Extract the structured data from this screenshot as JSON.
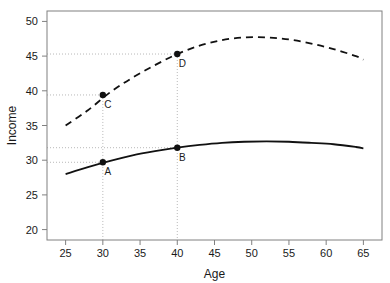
{
  "chart_data": {
    "type": "line",
    "title": "",
    "xlabel": "Age",
    "ylabel": "Income",
    "xlim": [
      22.5,
      67.5
    ],
    "ylim": [
      18.5,
      51.5
    ],
    "xticks": [
      25,
      30,
      35,
      40,
      45,
      50,
      55,
      60,
      65
    ],
    "xtick_labels": [
      "25",
      "30",
      "35",
      "40",
      "45",
      "50",
      "55",
      "60",
      "65"
    ],
    "yticks": [
      20,
      25,
      30,
      35,
      40,
      45,
      50
    ],
    "ytick_labels": [
      "20",
      "25",
      "30",
      "35",
      "40",
      "45",
      "50"
    ],
    "grid": false,
    "legend": "none",
    "series": [
      {
        "name": "solid-curve",
        "style": "solid",
        "color": "#111111",
        "x": [
          25,
          28,
          31,
          34,
          37,
          40,
          43,
          46,
          49,
          52,
          55,
          58,
          61,
          64,
          65
        ],
        "values": [
          28.0,
          29.0,
          29.9,
          30.7,
          31.3,
          31.8,
          32.2,
          32.5,
          32.66,
          32.72,
          32.66,
          32.5,
          32.3,
          31.9,
          31.7
        ]
      },
      {
        "name": "dashed-curve",
        "style": "dashed",
        "color": "#111111",
        "x": [
          25,
          28,
          31,
          34,
          37,
          40,
          43,
          46,
          49,
          52,
          55,
          58,
          61,
          64,
          65
        ],
        "values": [
          35.0,
          37.2,
          39.8,
          41.9,
          43.7,
          45.3,
          46.5,
          47.3,
          47.7,
          47.7,
          47.4,
          46.8,
          46.0,
          45.0,
          44.5
        ]
      }
    ],
    "points": [
      {
        "label": "A",
        "x": 30,
        "y": 29.7,
        "series": "solid-curve",
        "label_dx": 5,
        "label_dy": 13
      },
      {
        "label": "B",
        "x": 40,
        "y": 31.8,
        "series": "solid-curve",
        "label_dx": 5,
        "label_dy": 13
      },
      {
        "label": "C",
        "x": 30,
        "y": 39.4,
        "series": "dashed-curve",
        "label_dx": 5,
        "label_dy": 13
      },
      {
        "label": "D",
        "x": 40,
        "y": 45.3,
        "series": "dashed-curve",
        "label_dx": 5,
        "label_dy": 13
      }
    ],
    "guide_lines": [
      {
        "type": "vertical",
        "x": 30,
        "from_y": 39.4
      },
      {
        "type": "vertical",
        "x": 40,
        "from_y": 45.3
      },
      {
        "type": "horizontal",
        "y": 29.7,
        "to_x": 30
      },
      {
        "type": "horizontal",
        "y": 39.4,
        "to_x": 30
      },
      {
        "type": "horizontal",
        "y": 31.8,
        "to_x": 40
      },
      {
        "type": "horizontal",
        "y": 45.3,
        "to_x": 40
      }
    ],
    "colors": {
      "curve": "#111111",
      "frame": "#808080",
      "guide": "#b8b8b8",
      "text": "#1a1a1a"
    }
  }
}
